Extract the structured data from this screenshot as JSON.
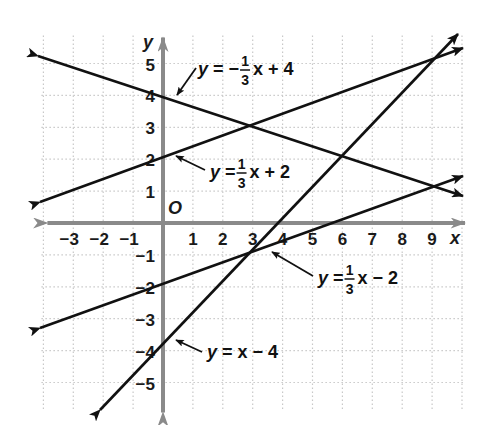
{
  "chart_data": {
    "type": "line",
    "title": "",
    "xlabel": "x",
    "ylabel": "y",
    "origin_label": "O",
    "xlim": [
      -4,
      10
    ],
    "ylim": [
      -6,
      6
    ],
    "grid": true,
    "x_ticks": [
      -3,
      -2,
      -1,
      1,
      2,
      3,
      4,
      5,
      6,
      7,
      8,
      9
    ],
    "y_ticks": [
      5,
      4,
      3,
      2,
      1,
      -1,
      -2,
      -3,
      -4,
      -5
    ],
    "x_tick_labels": [
      "−3",
      "−2",
      "−1",
      "1",
      "2",
      "3",
      "4",
      "5",
      "6",
      "7",
      "8",
      "9"
    ],
    "y_tick_labels": [
      "5",
      "4",
      "3",
      "2",
      "1",
      "−1",
      "−2",
      "−3",
      "−4",
      "−5"
    ],
    "series": [
      {
        "name": "y = −1/3x + 4",
        "slope": -0.3333,
        "intercept": 4,
        "x": [
          -4,
          10
        ],
        "y": [
          5.33,
          0.67
        ],
        "label": {
          "prefix": "y = −",
          "num": "1",
          "den": "3",
          "suffix": "x + 4"
        }
      },
      {
        "name": "y = 1/3x + 2",
        "slope": 0.3333,
        "intercept": 2,
        "x": [
          -4,
          10
        ],
        "y": [
          0.67,
          5.33
        ],
        "label": {
          "prefix": "y = ",
          "num": "1",
          "den": "3",
          "suffix": "x + 2"
        }
      },
      {
        "name": "y = 1/3x − 2",
        "slope": 0.3333,
        "intercept": -2,
        "x": [
          -4,
          10
        ],
        "y": [
          -3.33,
          1.33
        ],
        "label": {
          "prefix": "y = ",
          "num": "1",
          "den": "3",
          "suffix": "x − 2"
        }
      },
      {
        "name": "y = x − 4",
        "slope": 1,
        "intercept": -4,
        "x": [
          -2,
          9.6
        ],
        "y": [
          -6,
          5.6
        ],
        "label": {
          "prefix": "y = x − 4",
          "num": "",
          "den": "",
          "suffix": ""
        }
      }
    ],
    "intersections": [
      {
        "x": 3,
        "y": 3,
        "lines": [
          "y = −1/3x + 4",
          "y = 1/3x + 2"
        ]
      },
      {
        "x": 6,
        "y": 2,
        "lines": [
          "y = −1/3x + 4",
          "y = x − 4"
        ]
      },
      {
        "x": 9,
        "y": 1,
        "lines": [
          "y = −1/3x + 4",
          "y = 1/3x − 2"
        ]
      },
      {
        "x": 9,
        "y": 5,
        "lines": [
          "y = 1/3x + 2",
          "y = x − 4"
        ]
      },
      {
        "x": 3,
        "y": -1,
        "lines": [
          "y = 1/3x − 2",
          "y = x − 4"
        ]
      }
    ],
    "colors": {
      "lines": "#111111",
      "axes": "#8a8a8a",
      "grid": "#c8c8c8"
    }
  }
}
